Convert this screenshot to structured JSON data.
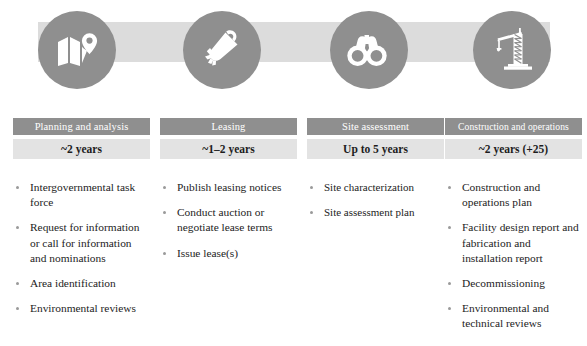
{
  "colors": {
    "circle_gray": "#8f8f8f",
    "connector_gray": "#dcdcdc",
    "title_bar_gray": "#8f8f8f",
    "duration_bar_gray": "#e3e3e3",
    "title_text": "#ffffff",
    "body_text": "#232323"
  },
  "icons": [
    {
      "name": "map-pin-icon",
      "label": "folded map with location pin"
    },
    {
      "name": "scroll-lease-icon",
      "label": "rolled scroll document with ribbon"
    },
    {
      "name": "binoculars-icon",
      "label": "binoculars"
    },
    {
      "name": "construction-crane-icon",
      "label": "construction crane"
    }
  ],
  "phases": [
    {
      "title": "Planning and analysis",
      "duration": "~2 years",
      "tasks": [
        "Intergovernmental task force",
        "Request for information or call for information and nominations",
        "Area identification",
        "Environmental reviews"
      ]
    },
    {
      "title": "Leasing",
      "duration": "~1–2 years",
      "tasks": [
        "Publish leasing notices",
        "Conduct auction or negotiate lease terms",
        "Issue lease(s)"
      ]
    },
    {
      "title": "Site assessment",
      "duration": "Up to 5 years",
      "tasks": [
        "Site characterization",
        "Site assessment plan"
      ]
    },
    {
      "title": "Construction and operations",
      "duration": "~2 years (+25)",
      "tasks": [
        "Construction and operations plan",
        "Facility design report and fabrication and installation report",
        "Decommissioning",
        "Environmental and technical reviews"
      ]
    }
  ]
}
